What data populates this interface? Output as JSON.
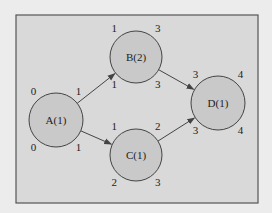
{
  "diagram": {
    "type": "activity-on-node network",
    "colors": {
      "page_bg": "#ececec",
      "frame_bg": "#d9d9d9",
      "frame_border": "#555555",
      "node_fill": "#c9c9c9",
      "node_stroke": "#444444",
      "edge": "#444444",
      "text": "#222222"
    },
    "nodes": [
      {
        "id": "A",
        "label": "A(1)",
        "cx": 56,
        "cy": 120,
        "r": 27,
        "early_start": "0",
        "early_finish": "1",
        "late_start": "0",
        "late_finish": "1"
      },
      {
        "id": "B",
        "label": "B(2)",
        "cx": 136,
        "cy": 57,
        "r": 26,
        "early_start": "1",
        "early_finish": "3",
        "late_start": "1",
        "late_finish": "3"
      },
      {
        "id": "C",
        "label": "C(1)",
        "cx": 136,
        "cy": 155,
        "r": 26,
        "early_start": "1",
        "early_finish": "2",
        "late_start": "2",
        "late_finish": "3"
      },
      {
        "id": "D",
        "label": "D(1)",
        "cx": 218,
        "cy": 103,
        "r": 27,
        "early_start": "3",
        "early_finish": "4",
        "late_start": "3",
        "late_finish": "4"
      }
    ],
    "edges": [
      {
        "from": "A",
        "to": "B"
      },
      {
        "from": "A",
        "to": "C"
      },
      {
        "from": "B",
        "to": "D"
      },
      {
        "from": "C",
        "to": "D"
      }
    ]
  }
}
